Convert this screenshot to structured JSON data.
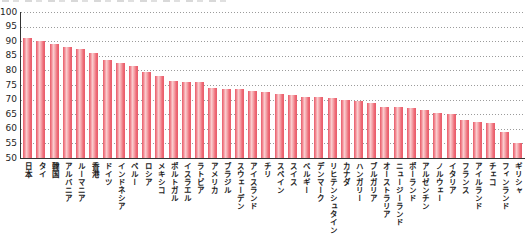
{
  "page": {
    "background": "#ffffff",
    "note": "bar chart, y-axis 50-100, horizontal dashed gridlines every 5, cropped title line at very top"
  },
  "colors": {
    "bar_edge": "#e85b69",
    "bar_mid": "#f0838d",
    "bar_highlight": "#fbccce",
    "gridline": "#9b9b9b",
    "axis": "#333333",
    "tick_text": "#1e1e1e",
    "category_text": "#222222"
  },
  "chart_data": {
    "type": "bar",
    "title": "",
    "xlabel": "",
    "ylabel": "",
    "ylim": [
      50,
      100
    ],
    "yticks": [
      100,
      95,
      90,
      85,
      80,
      75,
      70,
      65,
      60,
      55,
      50
    ],
    "grid": "horizontal-dashed",
    "legend_position": "none",
    "categories": [
      "日本",
      "タイ",
      "韓国",
      "アルバニア",
      "ルーマニア",
      "香港",
      "ドイツ",
      "インドネシア",
      "ペルー",
      "ロシア",
      "メキシコ",
      "ポルトガル",
      "イスラエル",
      "ラトビア",
      "アメリカ",
      "ブラジル",
      "スウェーデン",
      "アイスランド",
      "チリ",
      "スペイン",
      "スイス",
      "ベルギー",
      "デンマーク",
      "リヒテンシュタイン",
      "カナダ",
      "ハンガリー",
      "ブルガリア",
      "オーストラリア",
      "ニュージーランド",
      "ポーランド",
      "アルゼンチン",
      "ノルウェー",
      "イタリア",
      "フランス",
      "アイルランド",
      "チェコ",
      "フィンランド",
      "ギリシャ"
    ],
    "values": [
      91,
      90,
      89,
      88,
      87.5,
      86,
      83.5,
      82.5,
      81.5,
      79.5,
      78,
      76.5,
      76,
      76,
      74,
      73.5,
      73.5,
      73,
      72.5,
      72,
      71.5,
      71,
      71,
      70.5,
      70,
      69.5,
      69,
      67.5,
      67.5,
      67,
      66.5,
      65.5,
      65,
      63,
      62.5,
      62,
      59,
      55
    ]
  }
}
